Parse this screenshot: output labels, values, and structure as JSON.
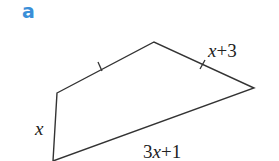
{
  "figure": {
    "part_label": "a",
    "shape": "quadrilateral",
    "vertices": {
      "top": [
        154,
        42
      ],
      "right": [
        254,
        88
      ],
      "bottom_left": [
        53,
        161
      ],
      "left": [
        57,
        93
      ]
    },
    "side_labels": {
      "left_side": {
        "var": "x",
        "rest": ""
      },
      "top_right_side": {
        "var": "x",
        "rest": "+3"
      },
      "bottom_side": {
        "coef": "3",
        "var": "x",
        "rest": "+1"
      }
    },
    "tick_marks": [
      "top-left side",
      "top-right side"
    ],
    "colors": {
      "line": "#333333",
      "label_a": "#3a8fd8"
    }
  }
}
